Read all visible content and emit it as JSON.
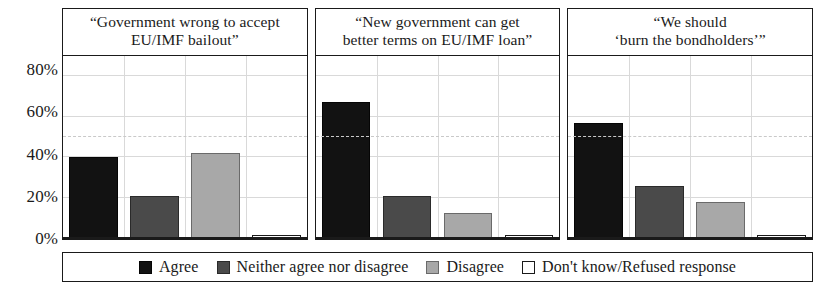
{
  "chart_data": {
    "type": "bar",
    "title": "",
    "xlabel": "",
    "ylabel": "",
    "ylim": [
      0,
      90
    ],
    "grid": true,
    "legend_position": "bottom",
    "y_ticks": [
      "0%",
      "20%",
      "40%",
      "60%",
      "80%"
    ],
    "y_tick_values": [
      0,
      20,
      40,
      60,
      80
    ],
    "reference_line": 50,
    "categories": [
      "Agree",
      "Neither agree nor disagree",
      "Disagree",
      "Don't know/Refused response"
    ],
    "panels": [
      {
        "title": "“Government wrong to accept EU/IMF bailout”",
        "title_line1": "“Government wrong to accept",
        "title_line2": "EU/IMF bailout”",
        "values": [
          40,
          21,
          42,
          2
        ]
      },
      {
        "title": "“New government can get better terms on EU/IMF loan”",
        "title_line1": "“New government can get",
        "title_line2": "better terms on EU/IMF loan”",
        "values": [
          67,
          21,
          13,
          2
        ]
      },
      {
        "title": "“We should ‘burn the bondholders’”",
        "title_line1": "“We should",
        "title_line2": "‘burn the bondholders’”",
        "values": [
          57,
          26,
          18,
          2
        ]
      }
    ],
    "series_colors": [
      "#121212",
      "#4a4a4a",
      "#a8a8a8",
      "#ffffff"
    ]
  },
  "legend": {
    "items": [
      {
        "label": "Agree"
      },
      {
        "label": "Neither agree nor disagree"
      },
      {
        "label": "Disagree"
      },
      {
        "label": "Don't know/Refused response"
      }
    ]
  }
}
